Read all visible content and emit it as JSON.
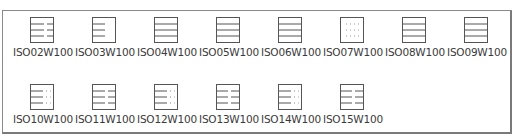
{
  "panel": {
    "title": "Line type palette",
    "items": [
      {
        "name": "ISO02W100",
        "pattern": "dash-long-gap-short"
      },
      {
        "name": "ISO03W100",
        "pattern": "short-dash-left"
      },
      {
        "name": "ISO04W100",
        "pattern": "solid"
      },
      {
        "name": "ISO05W100",
        "pattern": "solid"
      },
      {
        "name": "ISO06W100",
        "pattern": "solid"
      },
      {
        "name": "ISO07W100",
        "pattern": "dotted"
      },
      {
        "name": "ISO08W100",
        "pattern": "solid"
      },
      {
        "name": "ISO09W100",
        "pattern": "solid"
      },
      {
        "name": "ISO10W100",
        "pattern": "dash-dot"
      },
      {
        "name": "ISO11W100",
        "pattern": "dash-dash"
      },
      {
        "name": "ISO12W100",
        "pattern": "dash-dot"
      },
      {
        "name": "ISO13W100",
        "pattern": "dash-dash-dot"
      },
      {
        "name": "ISO14W100",
        "pattern": "dash-dot"
      },
      {
        "name": "ISO15W100",
        "pattern": "dash-dash-dot"
      }
    ]
  },
  "colors": {
    "border": "#8a8a8a",
    "icon_stroke": "#555555",
    "label": "#3a3a3a"
  }
}
